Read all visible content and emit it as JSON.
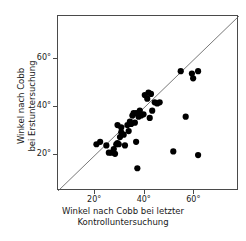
{
  "axes": {
    "x": {
      "title_line1": "Winkel nach Cobb bei letzter",
      "title_line2": "Kontrolluntersuchung",
      "ticks": [
        "20°",
        "40°",
        "60°"
      ]
    },
    "y": {
      "title_line1": "Winkel nach Cobb",
      "title_line2": "bei Erstuntersuchung",
      "ticks": [
        "20°",
        "40°",
        "60°"
      ]
    }
  },
  "chart_data": {
    "type": "scatter",
    "title": "",
    "xlabel": "Winkel nach Cobb bei letzter Kontrolluntersuchung",
    "ylabel": "Winkel nach Cobb bei Erstuntersuchung",
    "xlim": [
      5,
      78
    ],
    "ylim": [
      5,
      78
    ],
    "xticks": [
      20,
      40,
      60
    ],
    "yticks": [
      20,
      40,
      60
    ],
    "xticklabels": [
      "20°",
      "40°",
      "60°"
    ],
    "yticklabels": [
      "20°",
      "40°",
      "60°"
    ],
    "grid": false,
    "legend": false,
    "marker_color": "#000000",
    "marker_size": 3.1,
    "reference_line": {
      "name": "identity-line",
      "type": "identity",
      "from": [
        5,
        5
      ],
      "to": [
        78,
        78
      ],
      "color": "#555555"
    },
    "series": [
      {
        "name": "Patienten",
        "points": [
          [
            20.5,
            24.5
          ],
          [
            22.0,
            25.5
          ],
          [
            24.5,
            24.0
          ],
          [
            25.5,
            21.0
          ],
          [
            26.5,
            21.0
          ],
          [
            27.5,
            22.5
          ],
          [
            28.0,
            20.5
          ],
          [
            28.5,
            24.5
          ],
          [
            29.0,
            25.0
          ],
          [
            29.5,
            24.5
          ],
          [
            29.0,
            32.5
          ],
          [
            30.5,
            31.5
          ],
          [
            30.0,
            27.5
          ],
          [
            30.5,
            29.5
          ],
          [
            31.5,
            28.5
          ],
          [
            32.0,
            24.0
          ],
          [
            33.0,
            32.5
          ],
          [
            33.5,
            30.0
          ],
          [
            34.0,
            34.0
          ],
          [
            34.5,
            33.0
          ],
          [
            35.0,
            36.5
          ],
          [
            35.5,
            37.5
          ],
          [
            36.0,
            33.5
          ],
          [
            36.5,
            25.5
          ],
          [
            36.5,
            37.5
          ],
          [
            37.0,
            14.5
          ],
          [
            37.5,
            36.0
          ],
          [
            38.0,
            38.5
          ],
          [
            38.5,
            36.5
          ],
          [
            39.5,
            37.0
          ],
          [
            40.0,
            45.0
          ],
          [
            41.0,
            43.5
          ],
          [
            41.5,
            46.0
          ],
          [
            42.0,
            35.5
          ],
          [
            42.5,
            45.5
          ],
          [
            43.0,
            38.5
          ],
          [
            44.0,
            42.0
          ],
          [
            45.0,
            41.5
          ],
          [
            46.0,
            42.0
          ],
          [
            51.5,
            21.5
          ],
          [
            54.5,
            55.0
          ],
          [
            56.5,
            36.0
          ],
          [
            59.0,
            54.0
          ],
          [
            59.5,
            52.0
          ],
          [
            61.5,
            55.0
          ],
          [
            61.5,
            20.0
          ]
        ]
      }
    ]
  }
}
